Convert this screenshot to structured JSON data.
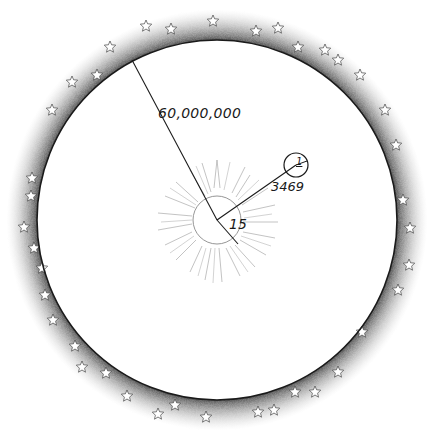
{
  "diagram": {
    "type": "scale-diagram",
    "labels": {
      "outer_radius": "60,000,000",
      "small_body_distance": "3469",
      "sun_radius": "15",
      "small_body_radius": "1"
    },
    "elements": {
      "outer_sphere": {
        "description": "large circle surrounded by stippled band with outlined stars",
        "center": [
          217,
          220
        ],
        "radius": 180
      },
      "sun": {
        "description": "circle with radiating ray strokes",
        "center": [
          217,
          220
        ],
        "radius": 24
      },
      "small_body": {
        "description": "small circle",
        "center": [
          296,
          165
        ],
        "radius": 12
      }
    },
    "colors": {
      "ink": "#1a1a1a",
      "stipple": "#555555",
      "sun_rays": "#999999",
      "background": "#ffffff"
    }
  }
}
